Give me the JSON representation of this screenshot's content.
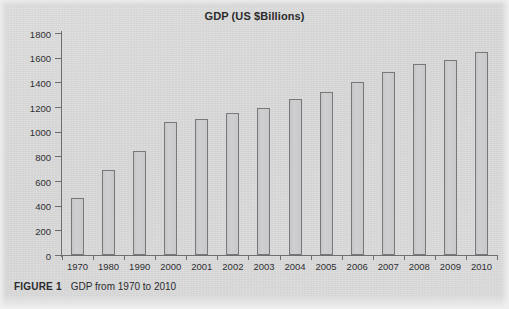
{
  "figure": {
    "caption_label": "FIGURE 1",
    "caption_text": "GDP from 1970 to 2010"
  },
  "colors": {
    "page_background": "#dcdcdc",
    "bar_fill": "#c9c9cb",
    "bar_stroke": "#78787b",
    "axis": "#6e6e70",
    "text": "#2f2f31"
  },
  "chart_data": {
    "type": "bar",
    "title": "GDP (US $Billions)",
    "xlabel": "",
    "ylabel": "",
    "ylim": [
      0,
      1800
    ],
    "ytick_step": 200,
    "yticks": [
      0,
      200,
      400,
      600,
      800,
      1000,
      1200,
      1400,
      1600,
      1800
    ],
    "grid": false,
    "legend": null,
    "categories": [
      "1970",
      "1980",
      "1990",
      "2000",
      "2001",
      "2002",
      "2003",
      "2004",
      "2005",
      "2006",
      "2007",
      "2008",
      "2009",
      "2010"
    ],
    "values": [
      465,
      690,
      840,
      1075,
      1105,
      1150,
      1190,
      1265,
      1325,
      1400,
      1480,
      1550,
      1580,
      1650
    ]
  }
}
